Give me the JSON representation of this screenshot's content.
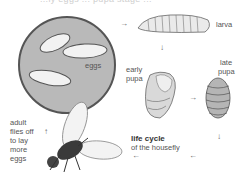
{
  "header": {
    "caption_partial": "...ly eggs ... pupa stage ..."
  },
  "stages": {
    "eggs": {
      "label": "eggs"
    },
    "larva": {
      "label": "larva"
    },
    "early_pupa": {
      "line1": "early",
      "line2": "pupa"
    },
    "late_pupa": {
      "line1": "late",
      "line2": "pupa"
    },
    "adult": {
      "line1": "adult",
      "line2": "flies off",
      "line3": "to lay",
      "line4": "more",
      "line5": "eggs"
    }
  },
  "title": {
    "line1": "life cycle",
    "line2": "of the housefly"
  },
  "arrows": {
    "right": "→",
    "down": "↓",
    "left": "←",
    "up": "↑"
  },
  "colors": {
    "circle_fill": "#b9b9b9",
    "circle_stroke": "#555555",
    "egg_fill": "#f2f2f2",
    "body": "#3a3a3a"
  }
}
